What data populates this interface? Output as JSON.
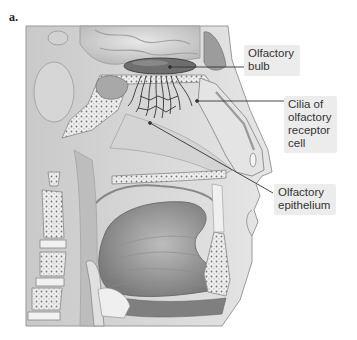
{
  "figure": {
    "panel_letter": "a.",
    "labels": [
      {
        "id": "olfactory-bulb",
        "lines": [
          "Olfactory",
          "bulb"
        ]
      },
      {
        "id": "cilia",
        "lines": [
          "Cilia of",
          "olfactory",
          "receptor",
          "cell"
        ]
      },
      {
        "id": "olfactory-epithelium",
        "lines": [
          "Olfactory",
          "epithelium"
        ]
      }
    ]
  },
  "colors": {
    "label_bg": "#ececec",
    "label_text": "#333333",
    "leader_line": "#333333",
    "tissue_light": "#d9d9d9",
    "tissue_dark": "#8a8a8a"
  }
}
